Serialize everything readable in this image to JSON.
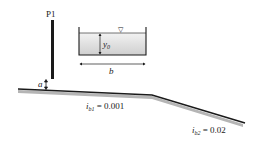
{
  "diagram": {
    "gate": {
      "label": "P1",
      "opening_label": "a"
    },
    "cross_section": {
      "depth_label": "y",
      "depth_sub": "0",
      "width_label": "b",
      "water_surface_symbol": "▽"
    },
    "reach1": {
      "slope_label": "i",
      "slope_sub": "b1",
      "slope_value": "= 0.001"
    },
    "reach2": {
      "slope_label": "i",
      "slope_sub": "b2",
      "slope_value": "= 0.02"
    },
    "colors": {
      "line": "#1a1a1a",
      "water": "#d8d8d8",
      "bed_hatch": "#aaaaaa"
    }
  }
}
